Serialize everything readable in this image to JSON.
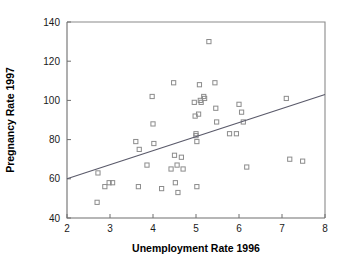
{
  "chart_data": {
    "type": "scatter",
    "title": "",
    "xlabel": "Unemployment Rate 1996",
    "ylabel": "Pregnancy Rate 1997",
    "xlim": [
      2,
      8
    ],
    "ylim": [
      40,
      140
    ],
    "xticks": [
      2,
      3,
      4,
      5,
      6,
      7,
      8
    ],
    "xtick_labels": [
      "2",
      "3",
      "4",
      "5",
      "6",
      "7",
      "8"
    ],
    "yticks": [
      40,
      60,
      80,
      100,
      120,
      140
    ],
    "ytick_labels": [
      "40",
      "60",
      "80",
      "100",
      "120",
      "140"
    ],
    "grid": false,
    "legend": null,
    "marker_style": "open-square",
    "points": [
      {
        "x": 2.7,
        "y": 48
      },
      {
        "x": 2.72,
        "y": 63
      },
      {
        "x": 2.88,
        "y": 56
      },
      {
        "x": 2.98,
        "y": 58
      },
      {
        "x": 3.06,
        "y": 58
      },
      {
        "x": 3.6,
        "y": 79
      },
      {
        "x": 3.68,
        "y": 75
      },
      {
        "x": 3.66,
        "y": 56
      },
      {
        "x": 3.86,
        "y": 67
      },
      {
        "x": 3.98,
        "y": 102
      },
      {
        "x": 4.0,
        "y": 88
      },
      {
        "x": 4.02,
        "y": 78
      },
      {
        "x": 4.2,
        "y": 55
      },
      {
        "x": 4.42,
        "y": 65
      },
      {
        "x": 4.48,
        "y": 109
      },
      {
        "x": 4.5,
        "y": 72
      },
      {
        "x": 4.52,
        "y": 58
      },
      {
        "x": 4.56,
        "y": 67
      },
      {
        "x": 4.58,
        "y": 53
      },
      {
        "x": 4.66,
        "y": 71
      },
      {
        "x": 4.7,
        "y": 65
      },
      {
        "x": 4.96,
        "y": 99
      },
      {
        "x": 4.98,
        "y": 92
      },
      {
        "x": 5.0,
        "y": 82
      },
      {
        "x": 5.0,
        "y": 83
      },
      {
        "x": 5.02,
        "y": 79
      },
      {
        "x": 5.02,
        "y": 56
      },
      {
        "x": 5.06,
        "y": 93
      },
      {
        "x": 5.08,
        "y": 108
      },
      {
        "x": 5.1,
        "y": 100
      },
      {
        "x": 5.12,
        "y": 99
      },
      {
        "x": 5.18,
        "y": 102
      },
      {
        "x": 5.2,
        "y": 101
      },
      {
        "x": 5.3,
        "y": 130
      },
      {
        "x": 5.44,
        "y": 109
      },
      {
        "x": 5.46,
        "y": 96
      },
      {
        "x": 5.48,
        "y": 89
      },
      {
        "x": 5.78,
        "y": 83
      },
      {
        "x": 5.94,
        "y": 83
      },
      {
        "x": 6.0,
        "y": 98
      },
      {
        "x": 6.06,
        "y": 94
      },
      {
        "x": 6.1,
        "y": 89
      },
      {
        "x": 6.18,
        "y": 66
      },
      {
        "x": 7.1,
        "y": 101
      },
      {
        "x": 7.18,
        "y": 70
      },
      {
        "x": 7.48,
        "y": 69
      }
    ],
    "trend_line": {
      "x_start": 2.0,
      "y_start": 60,
      "x_end": 8.0,
      "y_end": 103
    }
  },
  "colors": {
    "marker_stroke": "#8c8c8c",
    "trend_line": "#5a5a6a",
    "axis": "#6e6e6e",
    "frame": "#8a8a8a",
    "text": "#000000",
    "background": "#ffffff"
  }
}
